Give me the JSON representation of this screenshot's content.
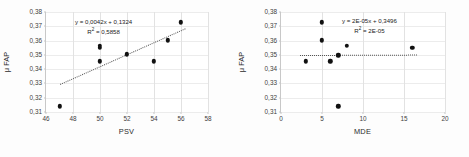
{
  "figure": {
    "background": "#fdfdfd",
    "marker_color": "#111111",
    "trendline_color": "#555555",
    "gridline_color": "#e2e2e2"
  },
  "chart_data": [
    {
      "type": "scatter",
      "title": "",
      "xlabel": "PSV",
      "ylabel": "μ FAP",
      "xlim": [
        46,
        58
      ],
      "ylim": [
        0.31,
        0.38
      ],
      "xticks": [
        "46",
        "48",
        "50",
        "52",
        "54",
        "56",
        "58"
      ],
      "xtick_values": [
        46,
        48,
        50,
        52,
        54,
        56,
        58
      ],
      "yticks": [
        "0,31",
        "0,32",
        "0,33",
        "0,34",
        "0,35",
        "0,36",
        "0,37",
        "0,38"
      ],
      "ytick_values": [
        0.31,
        0.32,
        0.33,
        0.34,
        0.35,
        0.36,
        0.37,
        0.38
      ],
      "grid": "vertical",
      "legend": "none",
      "x": [
        47,
        50,
        50,
        50,
        52,
        54,
        55,
        56
      ],
      "y": [
        0.314,
        0.3455,
        0.3548,
        0.3562,
        0.3505,
        0.3455,
        0.3602,
        0.3728
      ],
      "points": [
        {
          "x": 47,
          "y": 0.314
        },
        {
          "x": 50,
          "y": 0.3455
        },
        {
          "x": 50,
          "y": 0.3548
        },
        {
          "x": 50,
          "y": 0.3562
        },
        {
          "x": 52,
          "y": 0.3505
        },
        {
          "x": 54,
          "y": 0.3455
        },
        {
          "x": 55,
          "y": 0.3602
        },
        {
          "x": 56,
          "y": 0.3728
        }
      ],
      "trendline": {
        "equation": "y = 0,0042x + 0,1324",
        "r_squared_label": "R",
        "r_squared_sup": "2",
        "r_squared_value": " = 0,5858",
        "slope": 0.0042,
        "intercept": 0.1324,
        "x_start": 47,
        "x_end": 56.3,
        "style": "dotted"
      }
    },
    {
      "type": "scatter",
      "title": "",
      "xlabel": "MDE",
      "ylabel": "μ FAP",
      "xlim": [
        0,
        20
      ],
      "ylim": [
        0.31,
        0.38
      ],
      "xticks": [
        "0",
        "5",
        "10",
        "15",
        "20"
      ],
      "xtick_values": [
        0,
        5,
        10,
        15,
        20
      ],
      "yticks": [
        "0,31",
        "0,32",
        "0,33",
        "0,34",
        "0,35",
        "0,36",
        "0,37",
        "0,38"
      ],
      "ytick_values": [
        0.31,
        0.32,
        0.33,
        0.34,
        0.35,
        0.36,
        0.37,
        0.38
      ],
      "grid": "vertical",
      "legend": "none",
      "x": [
        3,
        5,
        5,
        6,
        7,
        7,
        8,
        16
      ],
      "y": [
        0.3455,
        0.3602,
        0.3728,
        0.3455,
        0.314,
        0.3498,
        0.3562,
        0.3548
      ],
      "points": [
        {
          "x": 3,
          "y": 0.3455
        },
        {
          "x": 5,
          "y": 0.3602
        },
        {
          "x": 5,
          "y": 0.3728
        },
        {
          "x": 6,
          "y": 0.3455
        },
        {
          "x": 7,
          "y": 0.314
        },
        {
          "x": 7,
          "y": 0.3498
        },
        {
          "x": 8,
          "y": 0.3562
        },
        {
          "x": 16,
          "y": 0.3548
        }
      ],
      "trendline": {
        "equation": "y = 2E-05x + 0,3496",
        "r_squared_label": "R",
        "r_squared_sup": "2",
        "r_squared_value": " = 2E-05",
        "slope": 2e-05,
        "intercept": 0.3496,
        "x_start": 2.3,
        "x_end": 16.6,
        "style": "dotted"
      }
    }
  ]
}
